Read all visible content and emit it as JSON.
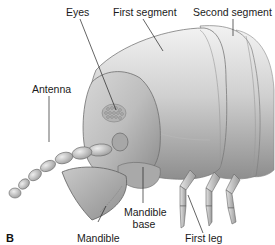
{
  "figure": {
    "panel_letter": "B",
    "labels": {
      "eyes": "Eyes",
      "first_segment": "First segment",
      "second_segment": "Second segment",
      "antenna": "Antenna",
      "mandible_base_line1": "Mandible",
      "mandible_base_line2": "base",
      "mandible": "Mandible",
      "first_leg": "First leg"
    },
    "colors": {
      "background": "#ffffff",
      "body_light": "#e6e6e6",
      "body_mid": "#b5b5b5",
      "body_dark": "#7a7a7a",
      "leader_line": "#222222",
      "text": "#1a1a1a"
    }
  }
}
